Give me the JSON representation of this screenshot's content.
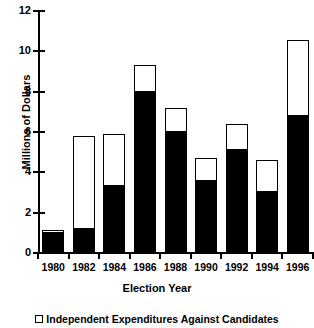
{
  "chart_data": {
    "type": "bar",
    "stacked": true,
    "title": "",
    "xlabel": "Election Year",
    "ylabel": "Millions of Dollars",
    "categories": [
      "1980",
      "1982",
      "1984",
      "1986",
      "1988",
      "1990",
      "1992",
      "1994",
      "1996"
    ],
    "ylim": [
      0,
      12
    ],
    "yticks": [
      "0",
      "2",
      "4",
      "6",
      "8",
      "10",
      "12"
    ],
    "ytick_values": [
      0,
      2,
      4,
      6,
      8,
      10,
      12
    ],
    "grid": false,
    "legend_position": "bottom",
    "series": [
      {
        "name": "Independent Expenditures For Candidates",
        "color": "#000000",
        "values": [
          1.0,
          1.2,
          3.3,
          8.0,
          6.0,
          3.55,
          5.1,
          3.05,
          6.8
        ]
      },
      {
        "name": "Independent Expenditures Against Candidates",
        "color": "#ffffff",
        "values": [
          0.15,
          4.6,
          2.6,
          1.3,
          1.2,
          1.15,
          1.3,
          1.55,
          3.75
        ]
      }
    ],
    "totals": [
      1.15,
      5.8,
      5.9,
      9.3,
      7.2,
      4.7,
      6.4,
      4.6,
      10.55
    ]
  },
  "legend": {
    "items": [
      {
        "label": "Independent Expenditures Against Candidates",
        "marker": "open-square"
      }
    ]
  }
}
